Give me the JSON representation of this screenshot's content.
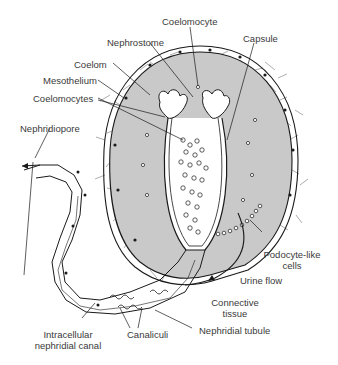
{
  "diagram": {
    "type": "anatomical-illustration",
    "colors": {
      "background": "#ffffff",
      "coelom_fill": "#c9c9c9",
      "line": "#1a1a1a",
      "label_text": "#3a3a3a"
    },
    "labels": {
      "coelomocyte": "Coelomocyte",
      "nephrostome": "Nephrostome",
      "capsule": "Capsule",
      "coelom": "Coelom",
      "mesothelium": "Mesothelium",
      "coelomocytes": "Coelomocytes",
      "nephridiopore": "Nephridiopore",
      "podocyte_line1": "Podocyte-like",
      "podocyte_line2": "cells",
      "urine_flow": "Urine flow",
      "connective_line1": "Connective",
      "connective_line2": "tissue",
      "intracellular_line1": "Intracellular",
      "intracellular_line2": "nephridial canal",
      "canaliculi": "Canaliculi",
      "nephridial_tubule": "Nephridial tubule"
    }
  }
}
